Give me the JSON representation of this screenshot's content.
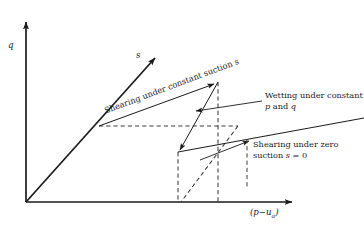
{
  "figure": {
    "type": "stress-path-diagram",
    "background": "#ffffff",
    "line_color": "#1a1a1a",
    "dashed_color": "#4a4a4a",
    "axes": {
      "vertical": {
        "label": "q",
        "name": "deviator-stress-axis"
      },
      "horizontal": {
        "label": "(p−u",
        "label_sub": "a",
        "label_end": ")",
        "name": "net-mean-stress-axis"
      },
      "diagonal": {
        "label": "s",
        "name": "suction-axis"
      }
    },
    "annotations": [
      {
        "id": "shearing-constant-suction",
        "text": "Shearing under constant suction s",
        "rotated": true,
        "angle": -20.5
      },
      {
        "id": "wetting-constant-p-q",
        "line1": "Wetting under constant",
        "line2_pre": "p",
        "line2_mid": " and ",
        "line2_post": "q"
      },
      {
        "id": "shearing-zero-suction",
        "line1": "Shearing under zero",
        "line2_pre": "suction ",
        "line2_var": "s",
        "line2_post": " = 0"
      }
    ]
  }
}
